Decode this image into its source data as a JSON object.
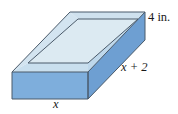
{
  "figure": {
    "kind": "open-rectangular-box-diagram",
    "labels": {
      "height": "4 in.",
      "length": "x + 2",
      "width": "x"
    },
    "colors": {
      "front_face": "#7EAEDC",
      "right_face": "#6E9FD2",
      "inner_floor": "#DCEAF2",
      "inner_back_wall": "#D3E4F0",
      "rim_top": "#C9DFEE",
      "edge_stroke": "#4A5A6A",
      "background": "#FFFFFF",
      "text": "#1A1A1A"
    },
    "geometry": {
      "outer_top_back_left": [
        70,
        12
      ],
      "outer_top_back_right": [
        145,
        12
      ],
      "outer_top_front_left": [
        12,
        72
      ],
      "outer_top_front_right": [
        88,
        72
      ],
      "outer_bottom_front_left": [
        12,
        99
      ],
      "outer_bottom_front_right": [
        88,
        99
      ],
      "outer_bottom_back_right": [
        145,
        40
      ],
      "inner_back_left": [
        78,
        19
      ],
      "inner_back_right": [
        138,
        19
      ],
      "inner_front_left": [
        28,
        63
      ],
      "inner_front_right": [
        88,
        63
      ]
    }
  }
}
